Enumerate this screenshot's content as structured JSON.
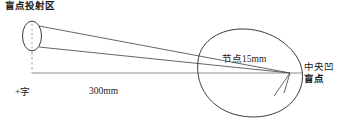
{
  "diagram": {
    "type": "optics-blind-spot-projection",
    "labels": {
      "projection_area": "盲点投射区",
      "cross_fixation": "+字",
      "distance": "300mm",
      "nodal_point": "节点15mm",
      "fovea": "中央凹",
      "blind_spot": "盲点"
    },
    "colors": {
      "stroke": "#3a3a3a",
      "axis": "#8a8a8a",
      "text": "#1a1a1a",
      "background": "#ffffff"
    },
    "geometry": {
      "projection_ellipse": {
        "cx": 32,
        "cy": 36,
        "rx": 10,
        "ry": 15
      },
      "eye": {
        "cx": 250,
        "cy": 71,
        "rx": 56,
        "ry": 42
      },
      "nodal_point": {
        "x": 290,
        "y": 73
      },
      "axis_line": {
        "x1": 32,
        "y1": 73,
        "x2": 302,
        "y2": 73
      },
      "dashed_drop": {
        "x": 32,
        "y1": 51,
        "y2": 73
      }
    }
  }
}
